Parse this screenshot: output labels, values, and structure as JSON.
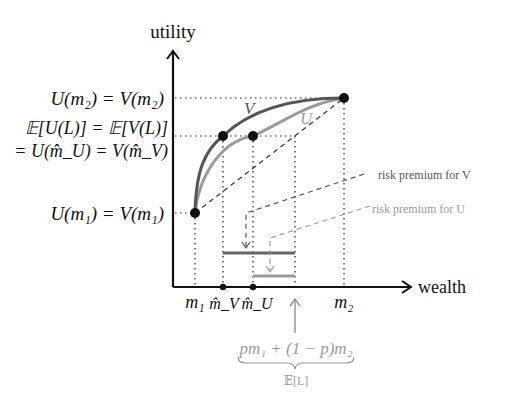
{
  "axes": {
    "y_label": "utility",
    "x_label": "wealth"
  },
  "y_ticks": {
    "top": "U(m₂) = V(m₂)",
    "mid_line1": "𝔼[U(L)] = 𝔼[V(L)]",
    "mid_line2": "= U(m̂_U) = V(m̂_V)",
    "bottom": "U(m₁) = V(m₁)"
  },
  "x_ticks": {
    "m1": "m₁",
    "mhat_v": "m̂_V",
    "mhat_u": "m̂_U",
    "m2": "m₂"
  },
  "curves": {
    "v_label": "V",
    "u_label": "U",
    "v_color": "#555555",
    "u_color": "#9a9a9a"
  },
  "annotations": {
    "risk_premium_v": "risk premium for V",
    "risk_premium_u": "risk premium for U",
    "expected_value_expr": "pm₁ + (1 − p)m₂",
    "expected_value_label": "𝔼[L]"
  }
}
